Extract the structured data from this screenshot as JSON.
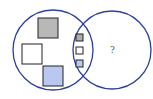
{
  "diagram": {
    "type": "venn",
    "colors": {
      "circle_stroke": "#2e3f9e",
      "square_stroke": "#222222",
      "gray_fill": "#b8b8b8",
      "white_fill": "#ffffff",
      "blue_fill": "#b9c8f0"
    },
    "left_set": {
      "label": "",
      "shapes": [
        {
          "kind": "large-square",
          "fill": "gray"
        },
        {
          "kind": "large-square",
          "fill": "white"
        },
        {
          "kind": "large-square",
          "fill": "blue"
        }
      ]
    },
    "intersection": {
      "shapes": [
        {
          "kind": "small-square",
          "fill": "gray"
        },
        {
          "kind": "small-square",
          "fill": "white"
        },
        {
          "kind": "small-square",
          "fill": "blue"
        }
      ]
    },
    "right_set": {
      "unknown_label": "?"
    }
  }
}
